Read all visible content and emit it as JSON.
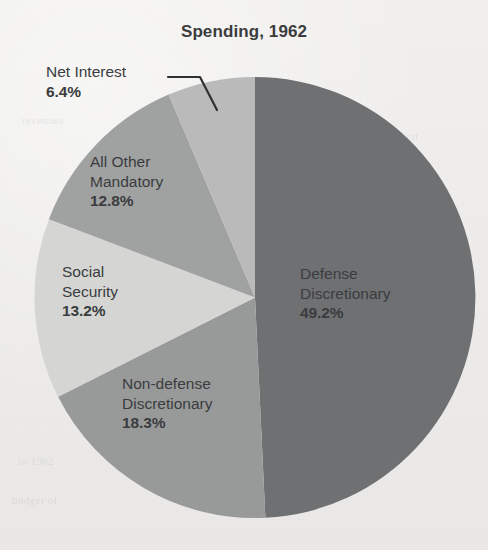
{
  "page": {
    "background_color": "#f1f0ee",
    "text_color": "#3b3c3e"
  },
  "header": {
    "title": "Spending, 1962"
  },
  "bleed_through_text": {
    "a": "the deficit",
    "b": "spending",
    "c": "in 1962",
    "d": "budget of",
    "e": "revenues"
  },
  "chart_data": {
    "type": "pie",
    "title": "Spending, 1962",
    "xlabel": "",
    "ylabel": "",
    "units": "percent",
    "start_angle_deg": 0,
    "direction": "clockwise",
    "legend_position": "none",
    "grid": false,
    "categories": [
      "Defense Discretionary",
      "Non-defense Discretionary",
      "Social Security",
      "All Other Mandatory",
      "Net Interest"
    ],
    "values": [
      49.2,
      18.3,
      13.2,
      12.8,
      6.4
    ],
    "value_labels": [
      "49.2%",
      "18.3%",
      "13.2%",
      "12.8%",
      "6.4%"
    ],
    "colors": [
      "#6e7072",
      "#989a9a",
      "#d5d6d4",
      "#a0a2a2",
      "#b9bab9"
    ],
    "slices": [
      {
        "name": "Defense Discretionary",
        "label_line1": "Defense",
        "label_line2": "Discretionary",
        "value": 49.2,
        "value_label": "49.2%",
        "color": "#6e7072",
        "label_placement": "inside",
        "leader_line": false
      },
      {
        "name": "Non-defense Discretionary",
        "label_line1": "Non-defense",
        "label_line2": "Discretionary",
        "value": 18.3,
        "value_label": "18.3%",
        "color": "#989a9a",
        "label_placement": "inside",
        "leader_line": false
      },
      {
        "name": "Social Security",
        "label_line1": "Social",
        "label_line2": "Security",
        "value": 13.2,
        "value_label": "13.2%",
        "color": "#d5d6d4",
        "label_placement": "outside",
        "leader_line": false
      },
      {
        "name": "All Other Mandatory",
        "label_line1": "All Other",
        "label_line2": "Mandatory",
        "value": 12.8,
        "value_label": "12.8%",
        "color": "#a0a2a2",
        "label_placement": "inside",
        "leader_line": false
      },
      {
        "name": "Net Interest",
        "label_line1": "Net Interest",
        "label_line2": "",
        "value": 6.4,
        "value_label": "6.4%",
        "color": "#b9bab9",
        "label_placement": "outside",
        "leader_line": true
      }
    ]
  }
}
